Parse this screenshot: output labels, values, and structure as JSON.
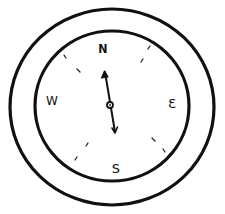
{
  "compass": {
    "labels": {
      "north": "N",
      "east": "Ɛ",
      "south": "S",
      "west": "W"
    },
    "needle": {
      "direction": "north",
      "heading_deg": -10
    },
    "colors": {
      "stroke": "#111111",
      "background": "#ffffff"
    }
  }
}
